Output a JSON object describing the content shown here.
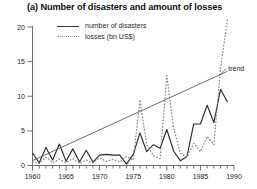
{
  "chart_data": {
    "type": "line",
    "title": "(a) Number of disasters and amount of losses",
    "xlabel": "",
    "ylabel": "",
    "xlim": [
      1960,
      1990
    ],
    "ylim": [
      0,
      21
    ],
    "grid": false,
    "legend_position": "top-center",
    "y_ticks": [
      "0",
      "5",
      "10",
      "15",
      "20"
    ],
    "y_tick_values": [
      0,
      5,
      10,
      15,
      20
    ],
    "x_ticks": [
      "1960",
      "1965",
      "1970",
      "1975",
      "1980",
      "1985",
      "1990"
    ],
    "x_tick_values": [
      1960,
      1965,
      1970,
      1975,
      1980,
      1985,
      1990
    ],
    "x_minor_step": 1,
    "annotations": [
      {
        "text": "trend",
        "x": 1989,
        "y": 14.0
      }
    ],
    "series": [
      {
        "name": "number of disasters",
        "style": "solid",
        "color": "#2b2b2b",
        "x": [
          1960,
          1961,
          1962,
          1963,
          1964,
          1965,
          1966,
          1967,
          1968,
          1969,
          1970,
          1971,
          1972,
          1973,
          1974,
          1975,
          1976,
          1977,
          1978,
          1979,
          1980,
          1981,
          1982,
          1983,
          1984,
          1985,
          1986,
          1987,
          1988,
          1989
        ],
        "values": [
          1.8,
          0.4,
          2.6,
          0.8,
          3.1,
          0.6,
          2.4,
          0.5,
          2.2,
          0.5,
          1.5,
          1.6,
          1.5,
          1.5,
          0.2,
          1.6,
          4.7,
          2.0,
          3.0,
          2.5,
          5.2,
          2.1,
          0.7,
          1.3,
          6.0,
          6.0,
          8.7,
          6.2,
          11.0,
          9.2
        ]
      },
      {
        "name": "losses (bn US$)",
        "style": "dotted",
        "color": "#8a8a8a",
        "x": [
          1960,
          1961,
          1962,
          1963,
          1964,
          1965,
          1966,
          1967,
          1968,
          1969,
          1970,
          1971,
          1972,
          1973,
          1974,
          1975,
          1976,
          1977,
          1978,
          1979,
          1980,
          1981,
          1982,
          1983,
          1984,
          1985,
          1986,
          1987,
          1988,
          1989
        ],
        "values": [
          0.5,
          0.3,
          1.2,
          0.4,
          0.9,
          0.4,
          1.0,
          0.3,
          0.8,
          0.4,
          1.1,
          0.6,
          0.9,
          0.5,
          1.3,
          0.8,
          9.5,
          3.0,
          1.4,
          1.0,
          13.0,
          5.5,
          1.8,
          1.2,
          3.2,
          2.0,
          4.2,
          3.0,
          14.0,
          21.0
        ]
      },
      {
        "name": "trend",
        "style": "solid-thin",
        "color": "#5c5c5c",
        "x": [
          1960,
          1989
        ],
        "values": [
          0.7,
          13.6
        ]
      }
    ]
  },
  "legend": {
    "entries": [
      {
        "label": "number of disasters",
        "style": "solid"
      },
      {
        "label": "losses (bn US$)",
        "style": "dotted"
      }
    ]
  },
  "colors": {
    "background": "#ffffff",
    "axis": "#6e6e6e",
    "disasters_line": "#2b2b2b",
    "losses_line": "#8a8a8a",
    "trend_line": "#5c5c5c",
    "text": "#1a1a1a"
  }
}
